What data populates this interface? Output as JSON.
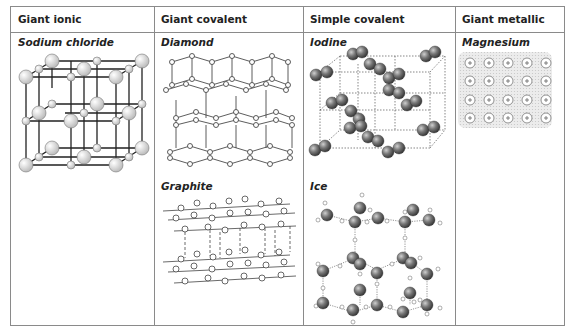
{
  "table": {
    "headers": [
      "Giant ionic",
      "Giant covalent",
      "Simple covalent",
      "Giant metallic"
    ],
    "cells": [
      {
        "column": 0,
        "label": "Sodium chloride",
        "diagram": "sodium-chloride-lattice"
      },
      {
        "column": 1,
        "label": "Diamond",
        "diagram": "diamond-lattice"
      },
      {
        "column": 2,
        "label": "Iodine",
        "diagram": "iodine-lattice"
      },
      {
        "column": 3,
        "label": "Magnesium",
        "diagram": "magnesium-metallic-lattice"
      },
      {
        "column": 1,
        "label": "Graphite",
        "diagram": "graphite-layers"
      },
      {
        "column": 2,
        "label": "Ice",
        "diagram": "ice-lattice"
      }
    ]
  },
  "labels": {
    "sodium_chloride": "Sodium chloride",
    "diamond": "Diamond",
    "iodine": "Iodine",
    "magnesium": "Magnesium",
    "graphite": "Graphite",
    "ice": "Ice"
  },
  "magnesium_ion_symbol": "+",
  "colors": {
    "border": "#8a8a8a",
    "text": "#222222",
    "sphere_light": "#e6e6e6",
    "sphere_dark": "#666666",
    "electron_sea": "#e8e8e8"
  }
}
